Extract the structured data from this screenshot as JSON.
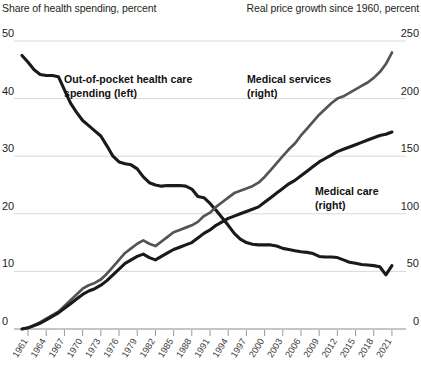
{
  "header": {
    "left_axis_title": "Share of health spending, percent",
    "right_axis_title": "Real price growth since 1960, percent"
  },
  "annotations": {
    "out_of_pocket": "Out-of-pocket health care\nspending (left)",
    "out_of_pocket_line1": "Out-of-pocket health care",
    "out_of_pocket_line2": "spending (left)",
    "medical_services_line1": "Medical services",
    "medical_services_line2": "(right)",
    "medical_care_line1": "Medical care",
    "medical_care_line2": "(right)"
  },
  "colors": {
    "out_of_pocket": "#1a1a1a",
    "medical_services": "#545454",
    "medical_care": "#1a1a1a",
    "gridline": "#d9d9d9",
    "axis": "#8c8c8c",
    "background": "#ffffff"
  },
  "chart_data": {
    "type": "line",
    "title": "",
    "xlabel": "",
    "grid": true,
    "legend_position": "inline-annotations",
    "x_axis": {
      "tick_labels": [
        "1961",
        "1964",
        "1967",
        "1970",
        "1973",
        "1976",
        "1979",
        "1982",
        "1985",
        "1988",
        "1991",
        "1994",
        "1997",
        "2000",
        "2003",
        "2006",
        "2009",
        "2012",
        "2015",
        "2018",
        "2021"
      ],
      "range": [
        1960,
        2022
      ]
    },
    "left_axis": {
      "label": "Share of health spending, percent",
      "tick_labels": [
        "0",
        "10",
        "20",
        "30",
        "40",
        "50"
      ],
      "ylim": [
        0,
        50
      ]
    },
    "right_axis": {
      "label": "Real price growth since 1960, percent",
      "tick_labels": [
        "0",
        "50",
        "100",
        "150",
        "200",
        "250"
      ],
      "ylim": [
        0,
        250
      ]
    },
    "x": [
      1960,
      1961,
      1962,
      1963,
      1964,
      1965,
      1966,
      1967,
      1968,
      1969,
      1970,
      1971,
      1972,
      1973,
      1974,
      1975,
      1976,
      1977,
      1978,
      1979,
      1980,
      1981,
      1982,
      1983,
      1984,
      1985,
      1986,
      1987,
      1988,
      1989,
      1990,
      1991,
      1992,
      1993,
      1994,
      1995,
      1996,
      1997,
      1998,
      1999,
      2000,
      2001,
      2002,
      2003,
      2004,
      2005,
      2006,
      2007,
      2008,
      2009,
      2010,
      2011,
      2012,
      2013,
      2014,
      2015,
      2016,
      2017,
      2018,
      2019,
      2020,
      2021
    ],
    "series": [
      {
        "name": "Out-of-pocket health care spending (left)",
        "axis": "left",
        "unit": "percent",
        "color": "#1a1a1a",
        "values": [
          47.5,
          46.3,
          45.0,
          44.2,
          44.0,
          44.0,
          43.8,
          41.5,
          39.2,
          37.6,
          36.2,
          35.3,
          34.4,
          33.5,
          31.8,
          30.0,
          29.0,
          28.7,
          28.5,
          27.8,
          26.4,
          25.4,
          25.0,
          24.8,
          24.9,
          24.9,
          24.9,
          24.8,
          24.3,
          23.0,
          22.8,
          21.8,
          20.6,
          19.3,
          18.0,
          16.6,
          15.6,
          15.0,
          14.7,
          14.6,
          14.6,
          14.6,
          14.4,
          14.0,
          13.8,
          13.6,
          13.4,
          13.3,
          13.1,
          12.6,
          12.5,
          12.5,
          12.4,
          12.0,
          11.6,
          11.4,
          11.2,
          11.1,
          11.0,
          10.8,
          9.4,
          11.0
        ]
      },
      {
        "name": "Medical services (right)",
        "axis": "right",
        "unit": "percent",
        "color": "#545454",
        "values": [
          0,
          1,
          3,
          6,
          9,
          12,
          15,
          20,
          25,
          30,
          35,
          38,
          40,
          43,
          48,
          54,
          60,
          66,
          70,
          74,
          77,
          74,
          72,
          76,
          80,
          84,
          86,
          88,
          90,
          93,
          98,
          101,
          106,
          110,
          114,
          118,
          120,
          122,
          124,
          127,
          132,
          138,
          144,
          150,
          156,
          161,
          168,
          174,
          180,
          186,
          191,
          196,
          200,
          202,
          205,
          208,
          211,
          214,
          218,
          223,
          230,
          240
        ]
      },
      {
        "name": "Medical care (right)",
        "axis": "right",
        "unit": "percent",
        "color": "#1a1a1a",
        "values": [
          0,
          1,
          3,
          5,
          8,
          11,
          14,
          18,
          22,
          26,
          30,
          33,
          35,
          38,
          42,
          47,
          52,
          57,
          60,
          63,
          65,
          62,
          60,
          63,
          66,
          69,
          71,
          73,
          75,
          79,
          83,
          86,
          90,
          93,
          96,
          98,
          100,
          102,
          104,
          106,
          110,
          114,
          118,
          122,
          126,
          129,
          133,
          137,
          141,
          145,
          148,
          151,
          154,
          156,
          158,
          160,
          162,
          164,
          166,
          168,
          169,
          171
        ]
      }
    ]
  }
}
